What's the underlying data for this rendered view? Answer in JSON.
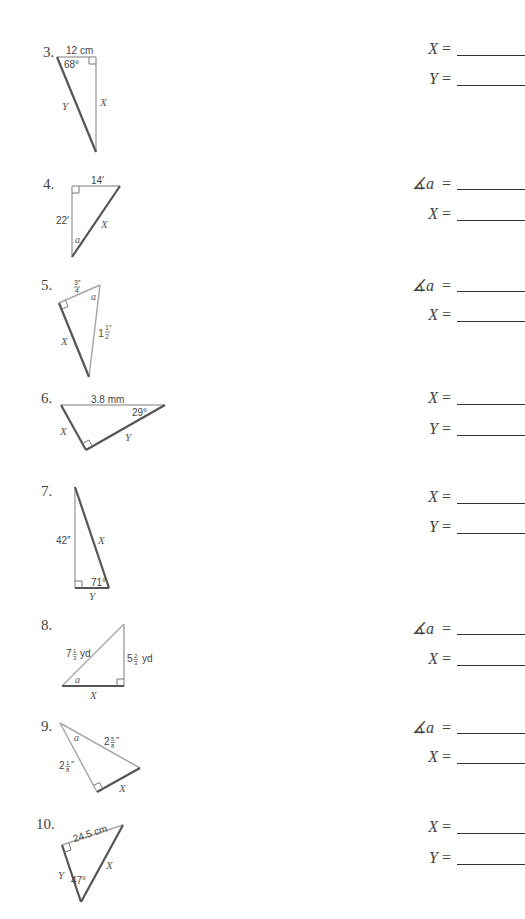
{
  "problems": [
    {
      "number": "3.",
      "labels": {
        "side_top": "12 cm",
        "angle": "68°",
        "side_left": "Y",
        "side_right": "X"
      },
      "answers": [
        {
          "var": "X",
          "sym": "=",
          "value": ""
        },
        {
          "var": "Y",
          "sym": "=",
          "value": ""
        }
      ]
    },
    {
      "number": "4.",
      "labels": {
        "side_top": "14′",
        "side_left": "22′",
        "angle": "a",
        "hyp": "X"
      },
      "answers": [
        {
          "var": "∡a",
          "sym": "=",
          "value": ""
        },
        {
          "var": "X",
          "sym": "=",
          "value": ""
        }
      ]
    },
    {
      "number": "5.",
      "labels": {
        "side_top_num": "3″",
        "side_top_den": "4",
        "angle": "a",
        "hyp_whole": "1",
        "hyp_num": "1″",
        "hyp_den": "2",
        "side_left": "X"
      },
      "answers": [
        {
          "var": "∡a",
          "sym": "=",
          "value": ""
        },
        {
          "var": "X",
          "sym": "=",
          "value": ""
        }
      ]
    },
    {
      "number": "6.",
      "labels": {
        "hyp": "3.8 mm",
        "angle": "29°",
        "side_left": "X",
        "side_bottom": "Y"
      },
      "answers": [
        {
          "var": "X",
          "sym": "=",
          "value": ""
        },
        {
          "var": "Y",
          "sym": "=",
          "value": ""
        }
      ]
    },
    {
      "number": "7.",
      "labels": {
        "side_left": "42″",
        "hyp": "X",
        "angle": "71°",
        "side_bottom": "Y"
      },
      "answers": [
        {
          "var": "X",
          "sym": "=",
          "value": ""
        },
        {
          "var": "Y",
          "sym": "=",
          "value": ""
        }
      ]
    },
    {
      "number": "8.",
      "labels": {
        "hyp_whole": "7",
        "hyp_num": "1",
        "hyp_den": "3",
        "hyp_unit": "yd",
        "side_right_whole": "5",
        "side_right_num": "2",
        "side_right_den": "3",
        "side_right_unit": "yd",
        "angle": "a",
        "side_bottom": "X"
      },
      "answers": [
        {
          "var": "∡a",
          "sym": "=",
          "value": ""
        },
        {
          "var": "X",
          "sym": "=",
          "value": ""
        }
      ]
    },
    {
      "number": "9.",
      "labels": {
        "hyp_whole": "2",
        "hyp_num": "5",
        "hyp_den": "8",
        "hyp_unit": "″",
        "side_left_whole": "2",
        "side_left_num": "1",
        "side_left_den": "8",
        "side_left_unit": "″",
        "angle": "a",
        "side_bottom": "X"
      },
      "answers": [
        {
          "var": "∡a",
          "sym": "=",
          "value": ""
        },
        {
          "var": "X",
          "sym": "=",
          "value": ""
        }
      ]
    },
    {
      "number": "10.",
      "labels": {
        "side_top": "24.5 cm",
        "side_left": "Y",
        "angle": "47°",
        "hyp": "X"
      },
      "answers": [
        {
          "var": "X",
          "sym": "=",
          "value": ""
        },
        {
          "var": "Y",
          "sym": "=",
          "value": ""
        }
      ]
    }
  ],
  "colors": {
    "light_line": "#a8a8a8",
    "dark_line": "#555555",
    "text": "#444444"
  }
}
